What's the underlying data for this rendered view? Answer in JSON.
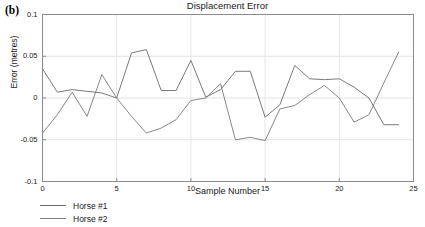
{
  "figure": {
    "panel_label": "(b)"
  },
  "chart_data": {
    "type": "line",
    "title": "Displacement Error",
    "xlabel": "Sample Number",
    "ylabel": "Error (metres)",
    "xlim": [
      0,
      25
    ],
    "ylim": [
      -0.1,
      0.1
    ],
    "xticks": [
      0,
      5,
      10,
      15,
      20,
      25
    ],
    "xtick_labels": [
      "0",
      "5",
      "10",
      "15",
      "20",
      "25"
    ],
    "yticks": [
      -0.1,
      -0.05,
      0,
      0.05,
      0.1
    ],
    "ytick_labels": [
      "-0.1",
      "-0.05",
      "0",
      "0.05",
      "0.1"
    ],
    "grid": true,
    "grid_axis": "y",
    "legend_position": "below-left",
    "x": [
      0,
      1,
      2,
      3,
      4,
      5,
      6,
      7,
      8,
      9,
      10,
      11,
      12,
      13,
      14,
      15,
      16,
      17,
      18,
      19,
      20,
      21,
      22,
      23,
      24
    ],
    "series": [
      {
        "name": "Horse #1",
        "color": "#6b6b6b",
        "values": [
          0.035,
          0.007,
          0.01,
          0.008,
          0.006,
          0.0,
          0.054,
          0.058,
          0.009,
          0.009,
          0.045,
          0.001,
          0.01,
          0.032,
          0.032,
          -0.023,
          -0.008,
          0.039,
          0.023,
          0.022,
          0.023,
          0.013,
          0.0,
          -0.032,
          -0.032
        ]
      },
      {
        "name": "Horse #2",
        "color": "#7a7a7a",
        "values": [
          -0.042,
          -0.02,
          0.007,
          -0.022,
          0.028,
          0.0,
          -0.022,
          -0.042,
          -0.036,
          -0.026,
          -0.003,
          0.0,
          0.017,
          -0.05,
          -0.047,
          -0.051,
          -0.013,
          -0.009,
          0.004,
          0.015,
          0.0,
          -0.029,
          -0.02,
          0.018,
          0.055
        ]
      }
    ]
  },
  "legend": {
    "items": [
      {
        "label": "Horse #1"
      },
      {
        "label": "Horse #2"
      }
    ]
  }
}
